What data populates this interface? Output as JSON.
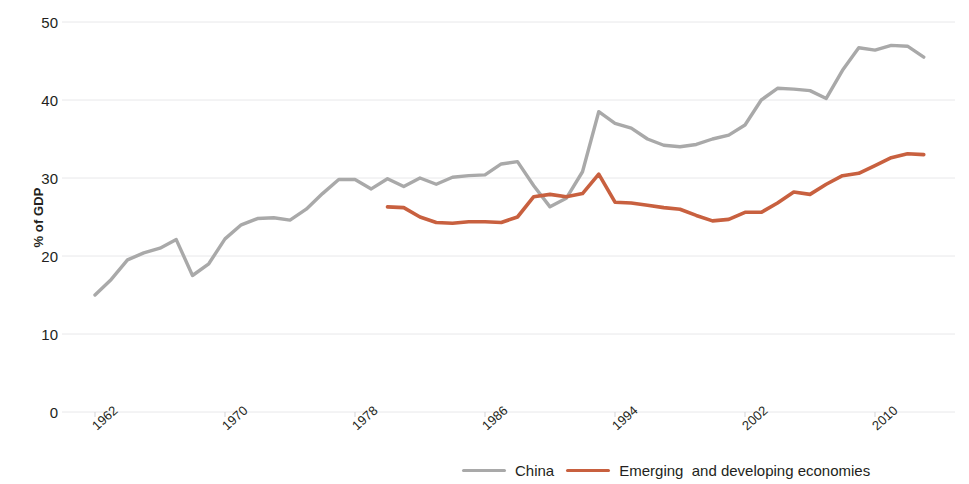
{
  "chart_data": {
    "type": "line",
    "title": "",
    "xlabel": "",
    "ylabel": "% of GDP",
    "xlim": [
      1962,
      2013
    ],
    "ylim": [
      0,
      50
    ],
    "grid": true,
    "gridlines_y": [
      0,
      10,
      20,
      30,
      40,
      50
    ],
    "x_ticks": [
      "1962",
      "1970",
      "1978",
      "1986",
      "1994",
      "2002",
      "2010"
    ],
    "x_tick_values": [
      1962,
      1970,
      1978,
      1986,
      1994,
      2002,
      2010
    ],
    "y_ticks": [
      "0",
      "10",
      "20",
      "30",
      "40",
      "50"
    ],
    "y_tick_values": [
      0,
      10,
      20,
      30,
      40,
      50
    ],
    "legend_position": "bottom",
    "colors": {
      "china": "#a9a9a9",
      "emerging": "#c8603f",
      "gridline": "#e8e8ea",
      "text": "#231f20",
      "background": "#ffffff"
    },
    "series": [
      {
        "name": "China",
        "color": "#a9a9a9",
        "x": [
          1962,
          1963,
          1964,
          1965,
          1966,
          1967,
          1968,
          1969,
          1970,
          1971,
          1972,
          1973,
          1974,
          1975,
          1976,
          1977,
          1978,
          1979,
          1980,
          1981,
          1982,
          1983,
          1984,
          1985,
          1986,
          1987,
          1988,
          1989,
          1990,
          1991,
          1992,
          1993,
          1994,
          1995,
          1996,
          1997,
          1998,
          1999,
          2000,
          2001,
          2002,
          2003,
          2004,
          2005,
          2006,
          2007,
          2008,
          2009,
          2010,
          2011,
          2012,
          2013
        ],
        "values": [
          15.0,
          17.0,
          19.5,
          20.4,
          21.0,
          22.1,
          17.5,
          19.0,
          22.2,
          24.0,
          24.8,
          24.9,
          24.6,
          26.0,
          28.0,
          29.8,
          29.8,
          28.6,
          29.9,
          28.9,
          30.0,
          29.2,
          30.1,
          30.3,
          30.4,
          31.8,
          32.1,
          29.0,
          26.3,
          27.4,
          30.8,
          38.5,
          37.0,
          36.4,
          35.0,
          34.2,
          34.0,
          34.3,
          35.0,
          35.5,
          36.8,
          40.0,
          41.5,
          41.4,
          41.2,
          40.2,
          43.8,
          46.7,
          46.4,
          47.0,
          46.9,
          45.5
        ]
      },
      {
        "name": "Emerging  and developing economies",
        "color": "#c8603f",
        "x": [
          1980,
          1981,
          1982,
          1983,
          1984,
          1985,
          1986,
          1987,
          1988,
          1989,
          1990,
          1991,
          1992,
          1993,
          1994,
          1995,
          1996,
          1997,
          1998,
          1999,
          2000,
          2001,
          2002,
          2003,
          2004,
          2005,
          2006,
          2007,
          2008,
          2009,
          2010,
          2011,
          2012,
          2013
        ],
        "values": [
          26.3,
          26.2,
          25.0,
          24.3,
          24.2,
          24.4,
          24.4,
          24.3,
          25.0,
          27.6,
          27.9,
          27.6,
          28.0,
          30.5,
          26.9,
          26.8,
          26.5,
          26.2,
          26.0,
          25.2,
          24.5,
          24.7,
          25.6,
          25.6,
          26.8,
          28.2,
          27.9,
          29.2,
          30.3,
          30.6,
          31.6,
          32.6,
          33.1,
          33.0
        ]
      }
    ]
  },
  "axis": {
    "y_title": "% of GDP"
  },
  "legend": {
    "items": [
      {
        "label": "China",
        "color": "#a9a9a9"
      },
      {
        "label": "Emerging  and developing economies",
        "color": "#c8603f"
      }
    ]
  }
}
